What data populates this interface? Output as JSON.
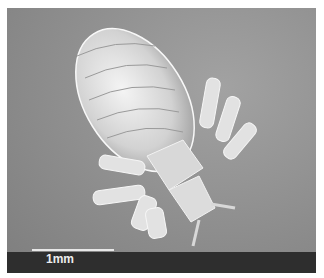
{
  "image": {
    "description": "Scanning electron micrograph of a louse, dorsal view",
    "subject": "louse",
    "scale_bar": {
      "label": "1mm"
    },
    "colors": {
      "background": "#8f8f8f",
      "band": "#2e2e2e",
      "specimen": "#e4e4e4",
      "scale_bar": "#e8e8e8"
    }
  }
}
